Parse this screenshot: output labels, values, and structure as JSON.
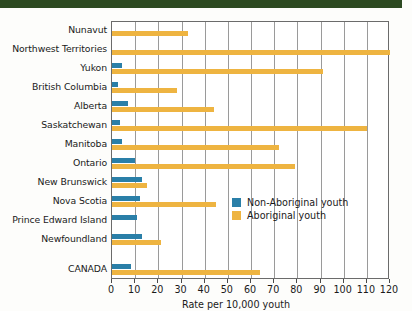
{
  "chart_data": {
    "type": "bar",
    "orientation": "horizontal",
    "title": "",
    "xlabel": "Rate per 10,000 youth",
    "ylabel": "",
    "xlim": [
      0,
      120
    ],
    "xticks": [
      0,
      10,
      20,
      30,
      40,
      50,
      60,
      70,
      80,
      90,
      100,
      110,
      120
    ],
    "grid": "vertical",
    "legend_position": "inside-right",
    "categories": [
      "Nunavut",
      "Northwest Territories",
      "Yukon",
      "British Columbia",
      "Alberta",
      "Saskatchewan",
      "Manitoba",
      "Ontario",
      "New Brunswick",
      "Nova Scotia",
      "Prince Edward Island",
      "Newfoundland",
      "CANADA"
    ],
    "series": [
      {
        "name": "Non-Aboriginal youth",
        "color": "#2a7fa8",
        "values": [
          null,
          null,
          4.5,
          2.5,
          7.0,
          3.5,
          4.5,
          10.0,
          13.0,
          12.0,
          11.0,
          13.0,
          8.0
        ]
      },
      {
        "name": "Aboriginal youth",
        "color": "#eeb441",
        "values": [
          33.0,
          120.0,
          91.0,
          28.0,
          44.0,
          110.0,
          72.0,
          79.0,
          15.0,
          45.0,
          null,
          21.0,
          64.0
        ]
      }
    ]
  },
  "legend": {
    "items": [
      {
        "label": "Non-Aboriginal youth",
        "color": "#2a7fa8"
      },
      {
        "label": "Aboriginal youth",
        "color": "#eeb441"
      }
    ]
  },
  "colors": {
    "non_aboriginal": "#2a7fa8",
    "aboriginal": "#eeb441",
    "top_band": "#2d4a21",
    "axis": "#6b6b6b",
    "gridline": "#9a9a9a"
  }
}
